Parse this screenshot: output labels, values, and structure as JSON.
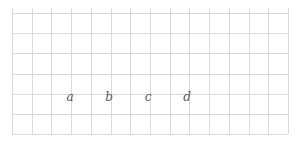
{
  "diagram": {
    "type": "grid-with-labels",
    "grid": {
      "left": 12,
      "top": 13,
      "right": 288,
      "bottom": 134,
      "columns": 14,
      "rows": 6,
      "line_color": "#d9d9d9",
      "background": "#ffffff"
    },
    "labels": [
      {
        "text": "a",
        "x": 70,
        "y": 97
      },
      {
        "text": "b",
        "x": 109,
        "y": 97
      },
      {
        "text": "c",
        "x": 148,
        "y": 97
      },
      {
        "text": "d",
        "x": 187,
        "y": 97
      }
    ]
  }
}
